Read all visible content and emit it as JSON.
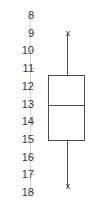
{
  "chart_data": {
    "type": "box",
    "title": "",
    "xlabel": "",
    "ylabel": "",
    "orientation": "vertical",
    "y_axis_inverted": true,
    "ylim": [
      8,
      18
    ],
    "y_ticks": [
      8,
      9,
      10,
      11,
      12,
      13,
      14,
      15,
      16,
      17,
      18
    ],
    "tick_labels": [
      "8",
      "9",
      "10",
      "11",
      "12",
      "13",
      "14",
      "15",
      "16",
      "17",
      "18"
    ],
    "grid": false,
    "legend": null,
    "categories": [
      "series-1"
    ],
    "boxes": [
      {
        "name": "series-1",
        "whisker_low": 9.1,
        "q1": 11.4,
        "median": 13.1,
        "q3": 15.1,
        "whisker_high": 17.7,
        "whisker_marker": "x",
        "outliers": []
      }
    ],
    "colors": {
      "box_outline": "#4c4c4c",
      "median": "#4c4c4c",
      "whisker": "#4c4c4c",
      "axis": "#d2d2d2",
      "tick_label": "#3a3a3a",
      "marker": "#2b2b2b",
      "background": "#ffffff"
    }
  },
  "axis": {
    "labels": [
      {
        "value": "8"
      },
      {
        "value": "9"
      },
      {
        "value": "10"
      },
      {
        "value": "11"
      },
      {
        "value": "12"
      },
      {
        "value": "13"
      },
      {
        "value": "14"
      },
      {
        "value": "15"
      },
      {
        "value": "16"
      },
      {
        "value": "17"
      },
      {
        "value": "18"
      }
    ]
  },
  "markers": {
    "upper": "x",
    "lower": "x"
  }
}
